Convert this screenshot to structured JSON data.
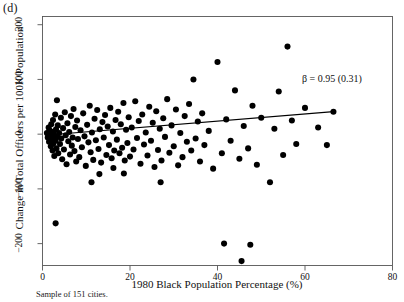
{
  "figure": {
    "panel_label": "(d)",
    "caption": "Sample of 151 cities.",
    "annotation": "β = 0.95 (0.31)"
  },
  "chart_data": {
    "type": "scatter",
    "title": "",
    "panel": "(d)",
    "xlabel": "1980 Black Population Percentage (%)",
    "ylabel": "Change in Total Officers per 100K Population",
    "xlim": [
      0,
      80
    ],
    "ylim": [
      -240,
      215
    ],
    "xticks": [
      0,
      20,
      40,
      60,
      80
    ],
    "xtick_labels": [
      "0",
      "20",
      "40",
      "60",
      "80"
    ],
    "yticks": [
      -200,
      -100,
      0,
      100,
      200
    ],
    "ytick_labels": [
      "−200",
      "−100",
      "0",
      "100",
      "200"
    ],
    "grid": false,
    "legend": false,
    "marker": {
      "shape": "circle",
      "color": "#000000",
      "size": 4.4
    },
    "annotations": [
      {
        "text": "β = 0.95 (0.31)",
        "x": 52.0,
        "y": 75.0
      }
    ],
    "fit_line": {
      "label": "OLS fit",
      "slope": 0.95,
      "se": 0.31,
      "color": "#000000",
      "x_start": 0.6,
      "y_start": -2.0,
      "x_end": 66.5,
      "y_end": 41.0
    },
    "points": [
      [
        1.0,
        2.0
      ],
      [
        1.2,
        -6.0
      ],
      [
        1.4,
        12.0
      ],
      [
        1.5,
        -14.0
      ],
      [
        1.6,
        7.0
      ],
      [
        1.8,
        -2.0
      ],
      [
        1.9,
        -22.0
      ],
      [
        2.0,
        18.0
      ],
      [
        2.1,
        -9.0
      ],
      [
        2.2,
        1.0
      ],
      [
        2.3,
        -30.0
      ],
      [
        2.4,
        26.0
      ],
      [
        2.5,
        -17.0
      ],
      [
        2.6,
        5.0
      ],
      [
        2.7,
        -40.0
      ],
      [
        2.8,
        -3.0
      ],
      [
        2.9,
        36.0
      ],
      [
        3.0,
        -12.0
      ],
      [
        3.1,
        9.0
      ],
      [
        3.2,
        -26.0
      ],
      [
        3.3,
        62.0
      ],
      [
        3.4,
        -5.0
      ],
      [
        3.5,
        16.0
      ],
      [
        3.6,
        -35.0
      ],
      [
        3.8,
        2.0
      ],
      [
        4.0,
        -18.0
      ],
      [
        4.2,
        30.0
      ],
      [
        4.3,
        -8.0
      ],
      [
        4.5,
        -46.0
      ],
      [
        4.7,
        11.0
      ],
      [
        4.9,
        -28.0
      ],
      [
        5.1,
        40.0
      ],
      [
        5.3,
        -2.0
      ],
      [
        5.5,
        -55.0
      ],
      [
        5.7,
        20.0
      ],
      [
        5.9,
        -13.0
      ],
      [
        6.1,
        4.0
      ],
      [
        6.3,
        -37.0
      ],
      [
        6.5,
        33.0
      ],
      [
        6.7,
        -21.0
      ],
      [
        3.0,
        -163.0
      ],
      [
        6.9,
        -6.0
      ],
      [
        7.1,
        46.0
      ],
      [
        7.3,
        -31.0
      ],
      [
        7.5,
        13.0
      ],
      [
        7.7,
        -50.0
      ],
      [
        7.9,
        25.0
      ],
      [
        8.1,
        -9.0
      ],
      [
        8.4,
        -42.0
      ],
      [
        8.7,
        7.0
      ],
      [
        9.0,
        -24.0
      ],
      [
        9.3,
        38.0
      ],
      [
        9.6,
        -4.0
      ],
      [
        9.9,
        -58.0
      ],
      [
        10.2,
        17.0
      ],
      [
        10.5,
        -15.0
      ],
      [
        10.8,
        52.0
      ],
      [
        11.0,
        -33.0
      ],
      [
        11.3,
        3.0
      ],
      [
        11.6,
        -47.0
      ],
      [
        11.2,
        -88.0
      ],
      [
        11.9,
        28.0
      ],
      [
        12.2,
        -11.0
      ],
      [
        12.5,
        44.0
      ],
      [
        12.8,
        -27.0
      ],
      [
        13.1,
        9.0
      ],
      [
        13.4,
        -52.0
      ],
      [
        13.0,
        -73.0
      ],
      [
        13.7,
        22.0
      ],
      [
        14.0,
        -6.0
      ],
      [
        14.3,
        35.0
      ],
      [
        14.6,
        -38.0
      ],
      [
        14.9,
        14.0
      ],
      [
        15.2,
        -20.0
      ],
      [
        15.5,
        48.0
      ],
      [
        15.8,
        -44.0
      ],
      [
        16.1,
        5.0
      ],
      [
        16.4,
        -30.0
      ],
      [
        16.2,
        -62.0
      ],
      [
        16.7,
        26.0
      ],
      [
        17.0,
        -10.0
      ],
      [
        17.3,
        41.0
      ],
      [
        17.6,
        -35.0
      ],
      [
        17.9,
        18.0
      ],
      [
        18.2,
        -25.0
      ],
      [
        18.5,
        57.0
      ],
      [
        18.8,
        -48.0
      ],
      [
        19.1,
        8.0
      ],
      [
        18.6,
        -72.0
      ],
      [
        19.4,
        -16.0
      ],
      [
        19.7,
        31.0
      ],
      [
        20.0,
        -41.0
      ],
      [
        20.4,
        12.0
      ],
      [
        20.8,
        -28.0
      ],
      [
        21.2,
        60.0
      ],
      [
        21.6,
        -7.0
      ],
      [
        22.0,
        24.0
      ],
      [
        22.4,
        -54.0
      ],
      [
        22.8,
        36.0
      ],
      [
        23.2,
        -19.0
      ],
      [
        23.6,
        3.0
      ],
      [
        24.0,
        -39.0
      ],
      [
        24.4,
        50.0
      ],
      [
        24.8,
        -12.0
      ],
      [
        25.2,
        21.0
      ],
      [
        25.6,
        -60.0
      ],
      [
        26.0,
        42.0
      ],
      [
        26.4,
        -29.0
      ],
      [
        26.8,
        10.0
      ],
      [
        27.2,
        -48.0
      ],
      [
        27.0,
        -88.0
      ],
      [
        27.6,
        29.0
      ],
      [
        28.0,
        -5.0
      ],
      [
        28.5,
        64.0
      ],
      [
        29.0,
        -34.0
      ],
      [
        29.5,
        16.0
      ],
      [
        30.0,
        -22.0
      ],
      [
        30.5,
        45.0
      ],
      [
        31.0,
        -57.0
      ],
      [
        31.5,
        2.0
      ],
      [
        32.0,
        -42.0
      ],
      [
        32.5,
        33.0
      ],
      [
        33.0,
        -14.0
      ],
      [
        33.5,
        55.0
      ],
      [
        34.0,
        -30.0
      ],
      [
        34.5,
        100.0
      ],
      [
        35.0,
        -8.0
      ],
      [
        35.5,
        23.0
      ],
      [
        36.0,
        -50.0
      ],
      [
        36.5,
        38.0
      ],
      [
        37.0,
        -20.0
      ],
      [
        38.0,
        6.0
      ],
      [
        39.0,
        -63.0
      ],
      [
        40.0,
        132.0
      ],
      [
        41.0,
        -35.0
      ],
      [
        41.5,
        -200.0
      ],
      [
        42.0,
        27.0
      ],
      [
        43.0,
        -12.0
      ],
      [
        44.0,
        80.0
      ],
      [
        45.0,
        -45.0
      ],
      [
        45.5,
        -232.0
      ],
      [
        46.0,
        15.0
      ],
      [
        47.0,
        -26.0
      ],
      [
        47.5,
        -202.0
      ],
      [
        48.0,
        52.0
      ],
      [
        49.0,
        -56.0
      ],
      [
        50.0,
        30.0
      ],
      [
        52.0,
        -88.0
      ],
      [
        53.0,
        10.0
      ],
      [
        54.0,
        78.0
      ],
      [
        55.0,
        -38.0
      ],
      [
        56.0,
        160.0
      ],
      [
        57.0,
        25.0
      ],
      [
        58.0,
        -18.0
      ],
      [
        60.0,
        48.0
      ],
      [
        63.0,
        12.0
      ],
      [
        65.0,
        -20.0
      ],
      [
        66.5,
        41.0
      ]
    ]
  }
}
